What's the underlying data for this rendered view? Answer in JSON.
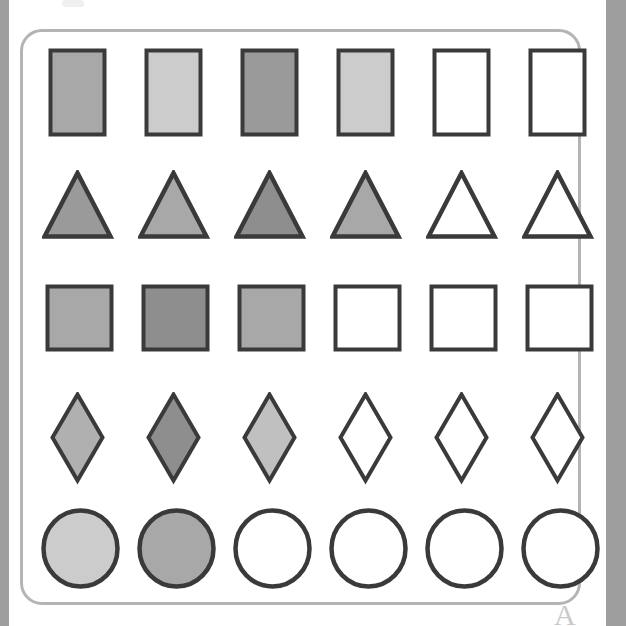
{
  "page": {
    "background_color": "#ffffff",
    "width": 626,
    "height": 626
  },
  "scan_artifacts": {
    "left_bar_color": "#9e9e9e",
    "right_bar_color": "#9e9e9e",
    "bottom_glyph": "A",
    "bottom_glyph_color": "#b9b9b9",
    "top_smudge_color": "#f0f0f0"
  },
  "frame": {
    "border_color": "#b4b4b4",
    "corner_radius": 22,
    "fill": "#ffffff"
  },
  "palette": {
    "outline": "#3a3a3a",
    "white": "#ffffff",
    "light_gray": "#cccccc",
    "medium_light_gray": "#bdbdbd",
    "medium_gray": "#a8a8a8",
    "medium_dark_gray": "#9a9a9a",
    "dark_gray": "#8e8e8e"
  },
  "grid": {
    "rows": 5,
    "columns": 6,
    "column_x": [
      48,
      144,
      240,
      336,
      432,
      528
    ],
    "row_y": [
      48,
      170,
      284,
      392,
      508
    ],
    "row_labels": [
      "rectangles",
      "triangles",
      "squares",
      "diamonds",
      "circles"
    ]
  },
  "rows": [
    {
      "name": "rectangles",
      "shape": "rectangle",
      "y": 48,
      "width": 54,
      "height": 84,
      "cells": [
        {
          "index": 1,
          "x": 48,
          "fill": "#a8a8a8",
          "shade": "medium-gray"
        },
        {
          "index": 2,
          "x": 144,
          "fill": "#cccccc",
          "shade": "light-gray"
        },
        {
          "index": 3,
          "x": 240,
          "fill": "#9a9a9a",
          "shade": "medium-dark-gray"
        },
        {
          "index": 4,
          "x": 336,
          "fill": "#cccccc",
          "shade": "light-gray"
        },
        {
          "index": 5,
          "x": 432,
          "fill": "#ffffff",
          "shade": "white"
        },
        {
          "index": 6,
          "x": 528,
          "fill": "#ffffff",
          "shade": "white"
        }
      ]
    },
    {
      "name": "triangles",
      "shape": "triangle",
      "y": 170,
      "width": 66,
      "height": 64,
      "cells": [
        {
          "index": 1,
          "x": 42,
          "fill": "#9a9a9a",
          "shade": "medium-dark-gray"
        },
        {
          "index": 2,
          "x": 138,
          "fill": "#a8a8a8",
          "shade": "medium-gray"
        },
        {
          "index": 3,
          "x": 234,
          "fill": "#8e8e8e",
          "shade": "dark-gray"
        },
        {
          "index": 4,
          "x": 330,
          "fill": "#a8a8a8",
          "shade": "medium-gray"
        },
        {
          "index": 5,
          "x": 426,
          "fill": "#ffffff",
          "shade": "white"
        },
        {
          "index": 6,
          "x": 522,
          "fill": "#ffffff",
          "shade": "white"
        }
      ]
    },
    {
      "name": "squares",
      "shape": "square",
      "y": 284,
      "width": 64,
      "height": 63,
      "cells": [
        {
          "index": 1,
          "x": 45,
          "fill": "#a8a8a8",
          "shade": "medium-gray"
        },
        {
          "index": 2,
          "x": 141,
          "fill": "#8e8e8e",
          "shade": "dark-gray"
        },
        {
          "index": 3,
          "x": 237,
          "fill": "#a8a8a8",
          "shade": "medium-gray"
        },
        {
          "index": 4,
          "x": 333,
          "fill": "#ffffff",
          "shade": "white"
        },
        {
          "index": 5,
          "x": 429,
          "fill": "#ffffff",
          "shade": "white"
        },
        {
          "index": 6,
          "x": 525,
          "fill": "#ffffff",
          "shade": "white"
        }
      ]
    },
    {
      "name": "diamonds",
      "shape": "diamond",
      "y": 392,
      "width": 50,
      "height": 86,
      "cells": [
        {
          "index": 1,
          "x": 50,
          "fill": "#b0b0b0",
          "shade": "medium-gray"
        },
        {
          "index": 2,
          "x": 146,
          "fill": "#8e8e8e",
          "shade": "dark-gray"
        },
        {
          "index": 3,
          "x": 242,
          "fill": "#c0c0c0",
          "shade": "medium-light-gray"
        },
        {
          "index": 4,
          "x": 338,
          "fill": "#ffffff",
          "shade": "white"
        },
        {
          "index": 5,
          "x": 434,
          "fill": "#ffffff",
          "shade": "white"
        },
        {
          "index": 6,
          "x": 530,
          "fill": "#ffffff",
          "shade": "white"
        }
      ]
    },
    {
      "name": "circles",
      "shape": "circle",
      "y": 508,
      "width": 74,
      "height": 76,
      "cells": [
        {
          "index": 1,
          "x": 41,
          "fill": "#cccccc",
          "shade": "light-gray"
        },
        {
          "index": 2,
          "x": 137,
          "fill": "#a8a8a8",
          "shade": "medium-gray"
        },
        {
          "index": 3,
          "x": 233,
          "fill": "#ffffff",
          "shade": "white"
        },
        {
          "index": 4,
          "x": 329,
          "fill": "#ffffff",
          "shade": "white"
        },
        {
          "index": 5,
          "x": 425,
          "fill": "#ffffff",
          "shade": "white"
        },
        {
          "index": 6,
          "x": 521,
          "fill": "#ffffff",
          "shade": "white"
        }
      ]
    }
  ]
}
